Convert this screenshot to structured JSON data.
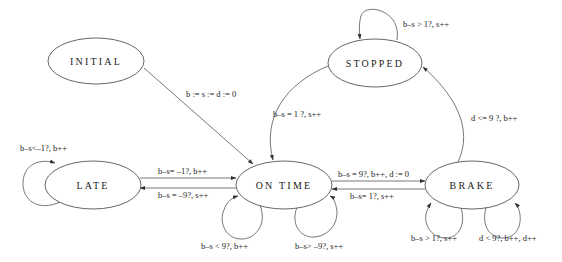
{
  "diagram": {
    "type": "state-machine",
    "nodes": {
      "initial": {
        "label": "INITIAL"
      },
      "stopped": {
        "label": "STOPPED"
      },
      "late": {
        "label": "LATE"
      },
      "on_time": {
        "label": "ON TIME"
      },
      "brake": {
        "label": "BRAKE"
      }
    },
    "edges": {
      "initial_to_on_time": {
        "from": "INITIAL",
        "to": "ON TIME",
        "label": "b := s := d := 0"
      },
      "stopped_self": {
        "from": "STOPPED",
        "to": "STOPPED",
        "label": "b–s > 1?, s++"
      },
      "stopped_to_on_time": {
        "from": "STOPPED",
        "to": "ON TIME",
        "label": "b–s = 1 ?, s++"
      },
      "brake_to_stopped": {
        "from": "BRAKE",
        "to": "STOPPED",
        "label": "d <= 9 ?,  b++"
      },
      "late_self": {
        "from": "LATE",
        "to": "LATE",
        "label": "b–s<–1?,  b++"
      },
      "late_to_on_time": {
        "from": "LATE",
        "to": "ON TIME",
        "label": "b–s= –1?, b++"
      },
      "on_time_to_late": {
        "from": "ON TIME",
        "to": "LATE",
        "label": "b–s = –9?, s++"
      },
      "on_time_self_left": {
        "from": "ON TIME",
        "to": "ON TIME",
        "label": "b–s < 9?, b++"
      },
      "on_time_self_right": {
        "from": "ON TIME",
        "to": "ON TIME",
        "label": "b–s> –9?, s++"
      },
      "on_time_to_brake": {
        "from": "ON TIME",
        "to": "BRAKE",
        "label": "b–s = 9?, b++, d := 0"
      },
      "brake_to_on_time": {
        "from": "BRAKE",
        "to": "ON TIME",
        "label": "b–s= 1?, s++"
      },
      "brake_self_left": {
        "from": "BRAKE",
        "to": "BRAKE",
        "label": "b–s > 1?, s++"
      },
      "brake_self_right": {
        "from": "BRAKE",
        "to": "BRAKE",
        "label": "d < 9?, b++, d++"
      }
    },
    "colors": {
      "stroke": "#555555",
      "text": "#222222",
      "background": "#ffffff"
    }
  }
}
